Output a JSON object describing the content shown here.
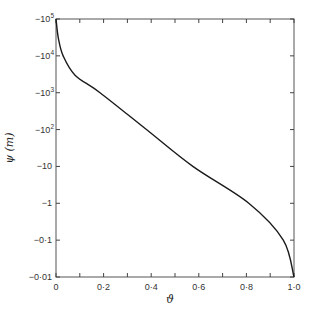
{
  "chart_data": {
    "type": "line",
    "title": "",
    "xlabel": "ϑ",
    "ylabel": "ψ (m)",
    "xlim": [
      0,
      1.0
    ],
    "ylim": [
      -0.01,
      -100000
    ],
    "yscale": "log (negative values, magnitude increasing upward)",
    "grid": false,
    "legend": "none",
    "x_ticks": [
      0,
      0.1,
      0.2,
      0.3,
      0.4,
      0.5,
      0.6,
      0.7,
      0.8,
      0.9,
      1.0
    ],
    "x_tick_labels": [
      {
        "value": 0,
        "label": "0"
      },
      {
        "value": 0.2,
        "label": "0·2"
      },
      {
        "value": 0.4,
        "label": "0·4"
      },
      {
        "value": 0.6,
        "label": "0·6"
      },
      {
        "value": 0.8,
        "label": "0·8"
      },
      {
        "value": 1.0,
        "label": "1·0"
      }
    ],
    "y_tick_labels": [
      {
        "value": -100000,
        "label": "−10",
        "sup": "5"
      },
      {
        "value": -10000,
        "label": "−10",
        "sup": "4"
      },
      {
        "value": -1000,
        "label": "−10",
        "sup": "3"
      },
      {
        "value": -100,
        "label": "−10",
        "sup": "2"
      },
      {
        "value": -10,
        "label": "−10",
        "sup": ""
      },
      {
        "value": -1,
        "label": "−1",
        "sup": ""
      },
      {
        "value": -0.1,
        "label": "−0·1",
        "sup": ""
      },
      {
        "value": -0.01,
        "label": "−0·01",
        "sup": ""
      }
    ],
    "series": [
      {
        "name": "ψ(ϑ)",
        "x": [
          0.0,
          0.01,
          0.03,
          0.08,
          0.185,
          0.38,
          0.575,
          0.81,
          0.955,
          1.0
        ],
        "y": [
          -100000,
          -30000,
          -10000,
          -3000,
          -1000,
          -100,
          -10,
          -1,
          -0.1,
          -0.01
        ]
      }
    ]
  }
}
